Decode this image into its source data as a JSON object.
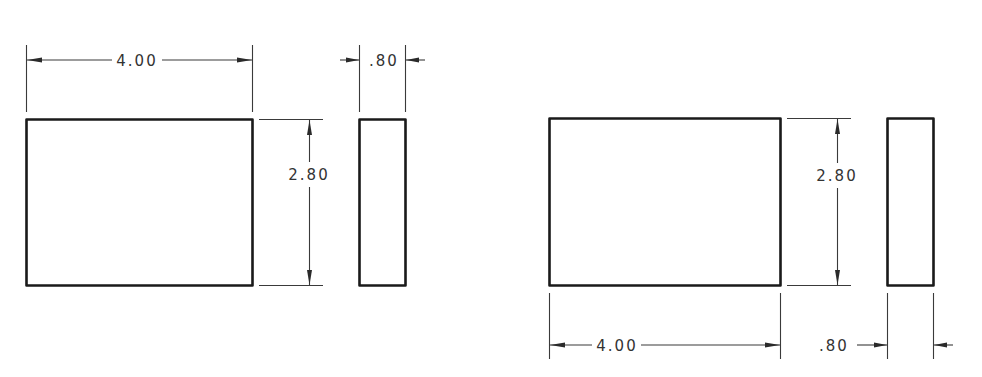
{
  "drawing": {
    "type": "orthographic-views",
    "line_color": "#1a1a1a",
    "text_color": "#333333",
    "background": "#ffffff",
    "view_set_a": {
      "position": "left",
      "front_view": {
        "width_label": "4.00",
        "height_label": "2.80"
      },
      "side_view": {
        "thickness_label": ".80"
      },
      "width_dim_placement": "above",
      "thickness_dim_placement": "above"
    },
    "view_set_b": {
      "position": "right",
      "front_view": {
        "width_label": "4.00",
        "height_label": "2.80"
      },
      "side_view": {
        "thickness_label": ".80"
      },
      "width_dim_placement": "below",
      "thickness_dim_placement": "below"
    }
  }
}
